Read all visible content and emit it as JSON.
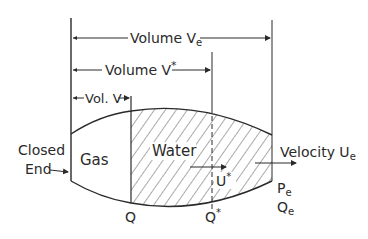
{
  "diagram": {
    "labels": {
      "volume_ve": "Volume  V",
      "volume_ve_sub": "e",
      "volume_vstar": "Volume  V",
      "volume_vstar_sup": "*",
      "vol_v": "Vol. V",
      "closed": "Closed",
      "end": "End",
      "gas": "Gas",
      "water": "Water",
      "ustar": "U",
      "ustar_sup": "*",
      "velocity": "Velocity  U",
      "velocity_sub": "e",
      "pe": "P",
      "pe_sub": "e",
      "qe": "Q",
      "qe_sub": "e",
      "q": "Q",
      "qstar": "Q",
      "qstar_sup": "*"
    },
    "colors": {
      "ink": "#2a2a2a",
      "background": "#ffffff"
    }
  }
}
